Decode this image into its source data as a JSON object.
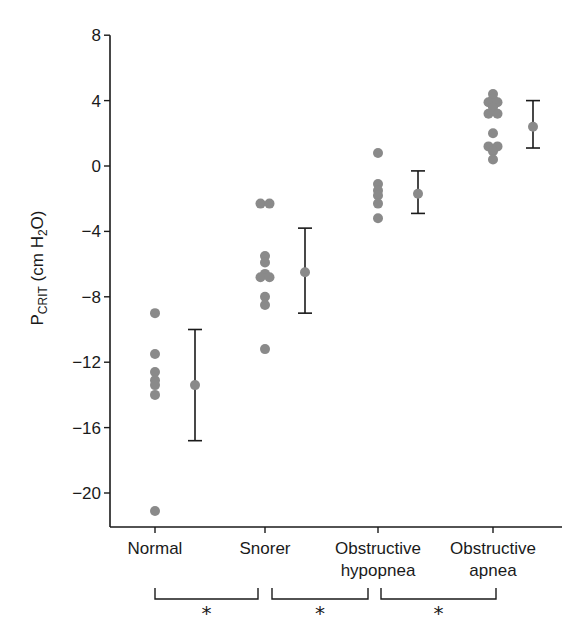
{
  "chart_data": {
    "type": "scatter",
    "title": "",
    "xlabel": "",
    "ylabel": "PCRIT (cm H2O)",
    "ylabel_parts": {
      "main": "P",
      "sub": "CRIT",
      "unit_pre": " (cm H",
      "unit_sub": "2",
      "unit_post": "O)"
    },
    "ylim": [
      -22,
      8
    ],
    "yticks": [
      8,
      4,
      0,
      -4,
      -8,
      -12,
      -16,
      -20
    ],
    "ytick_labels": [
      "8",
      "4",
      "0",
      "−4",
      "−8",
      "−12",
      "−16",
      "−20"
    ],
    "grid": false,
    "categories": [
      "Normal",
      "Snorer",
      "Obstructive hypopnea",
      "Obstructive apnea"
    ],
    "category_labels": [
      [
        "Normal"
      ],
      [
        "Snorer"
      ],
      [
        "Obstructive",
        "hypopnea"
      ],
      [
        "Obstructive",
        "apnea"
      ]
    ],
    "series": [
      {
        "name": "Normal",
        "points": [
          -9.0,
          -11.5,
          -12.6,
          -13.1,
          -13.4,
          -14.0,
          -21.1
        ],
        "mean": -13.4,
        "error_upper": -10.0,
        "error_lower": -16.8
      },
      {
        "name": "Snorer",
        "points": [
          -2.3,
          -2.3,
          -5.5,
          -5.9,
          -6.6,
          -6.8,
          -6.8,
          -8.0,
          -8.5,
          -11.2
        ],
        "mean": -6.5,
        "error_upper": -3.8,
        "error_lower": -9.0
      },
      {
        "name": "Obstructive hypopnea",
        "points": [
          0.8,
          -1.1,
          -1.5,
          -1.8,
          -2.3,
          -3.2
        ],
        "mean": -1.7,
        "error_upper": -0.3,
        "error_lower": -2.9
      },
      {
        "name": "Obstructive apnea",
        "points": [
          4.4,
          4.1,
          3.9,
          3.9,
          3.6,
          3.2,
          3.2,
          2.0,
          1.2,
          1.2,
          0.9,
          0.4
        ],
        "mean": 2.4,
        "error_upper": 4.0,
        "error_lower": 1.1
      }
    ],
    "significance": [
      {
        "from": "Normal",
        "to": "Snorer",
        "mark": "*"
      },
      {
        "from": "Snorer",
        "to": "Obstructive hypopnea",
        "mark": "*"
      },
      {
        "from": "Obstructive hypopnea",
        "to": "Obstructive apnea",
        "mark": "*"
      }
    ],
    "colors": {
      "points": "#8a8a8a",
      "axis": "#1a1a1a"
    }
  }
}
